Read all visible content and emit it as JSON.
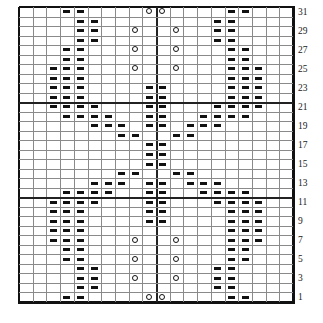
{
  "chart_data": {
    "type": "knitting-chart",
    "columns": 20,
    "rows": 31,
    "row_labels": [
      "1",
      "3",
      "5",
      "7",
      "9",
      "11",
      "13",
      "15",
      "17",
      "19",
      "21",
      "23",
      "25",
      "27",
      "29",
      "31"
    ],
    "major_horizontal_lines_above_rows": [
      21,
      11
    ],
    "major_vertical_line_after_column": 10,
    "legend_symbols": {
      "dash": "purl",
      "circle": "yarn-over"
    },
    "grid": [
      {
        "row": 31,
        "dash": [
          4,
          5,
          16,
          17
        ],
        "circle": [
          10,
          11
        ]
      },
      {
        "row": 30,
        "dash": [
          5,
          6,
          15,
          16
        ],
        "circle": []
      },
      {
        "row": 29,
        "dash": [
          5,
          6,
          15,
          16
        ],
        "circle": [
          9,
          12
        ]
      },
      {
        "row": 28,
        "dash": [
          5,
          6,
          15,
          16
        ],
        "circle": []
      },
      {
        "row": 27,
        "dash": [
          4,
          5,
          16,
          17
        ],
        "circle": [
          9,
          12
        ]
      },
      {
        "row": 26,
        "dash": [
          4,
          5,
          16,
          17
        ],
        "circle": []
      },
      {
        "row": 25,
        "dash": [
          3,
          4,
          5,
          16,
          17,
          18
        ],
        "circle": [
          9,
          12
        ]
      },
      {
        "row": 24,
        "dash": [
          3,
          4,
          5,
          16,
          17,
          18
        ],
        "circle": []
      },
      {
        "row": 23,
        "dash": [
          3,
          4,
          5,
          10,
          11,
          16,
          17,
          18
        ],
        "circle": []
      },
      {
        "row": 22,
        "dash": [
          3,
          4,
          5,
          10,
          11,
          16,
          17,
          18
        ],
        "circle": []
      },
      {
        "row": 21,
        "dash": [
          3,
          4,
          5,
          6,
          10,
          11,
          15,
          16,
          17,
          18
        ],
        "circle": []
      },
      {
        "row": 20,
        "dash": [
          4,
          5,
          6,
          7,
          10,
          11,
          14,
          15,
          16,
          17
        ],
        "circle": []
      },
      {
        "row": 19,
        "dash": [
          6,
          7,
          8,
          10,
          11,
          13,
          14,
          15
        ],
        "circle": []
      },
      {
        "row": 18,
        "dash": [
          8,
          9,
          12,
          13
        ],
        "circle": []
      },
      {
        "row": 17,
        "dash": [
          10,
          11
        ],
        "circle": []
      },
      {
        "row": 16,
        "dash": [
          10,
          11
        ],
        "circle": []
      },
      {
        "row": 15,
        "dash": [
          10,
          11
        ],
        "circle": []
      },
      {
        "row": 14,
        "dash": [
          8,
          9,
          12,
          13
        ],
        "circle": []
      },
      {
        "row": 13,
        "dash": [
          6,
          7,
          8,
          10,
          11,
          13,
          14,
          15
        ],
        "circle": []
      },
      {
        "row": 12,
        "dash": [
          4,
          5,
          6,
          7,
          10,
          11,
          14,
          15,
          16,
          17
        ],
        "circle": []
      },
      {
        "row": 11,
        "dash": [
          3,
          4,
          5,
          6,
          10,
          11,
          15,
          16,
          17,
          18
        ],
        "circle": []
      },
      {
        "row": 10,
        "dash": [
          3,
          4,
          5,
          10,
          11,
          16,
          17,
          18
        ],
        "circle": []
      },
      {
        "row": 9,
        "dash": [
          3,
          4,
          5,
          10,
          11,
          16,
          17,
          18
        ],
        "circle": []
      },
      {
        "row": 8,
        "dash": [
          3,
          4,
          5,
          16,
          17,
          18
        ],
        "circle": []
      },
      {
        "row": 7,
        "dash": [
          3,
          4,
          5,
          16,
          17,
          18
        ],
        "circle": [
          9,
          12
        ]
      },
      {
        "row": 6,
        "dash": [
          4,
          5,
          16,
          17
        ],
        "circle": []
      },
      {
        "row": 5,
        "dash": [
          4,
          5,
          16,
          17
        ],
        "circle": [
          9,
          12
        ]
      },
      {
        "row": 4,
        "dash": [
          5,
          6,
          15,
          16
        ],
        "circle": []
      },
      {
        "row": 3,
        "dash": [
          5,
          6,
          15,
          16
        ],
        "circle": [
          9,
          12
        ]
      },
      {
        "row": 2,
        "dash": [
          5,
          6,
          15,
          16
        ],
        "circle": []
      },
      {
        "row": 1,
        "dash": [
          4,
          5,
          16,
          17
        ],
        "circle": [
          10,
          11
        ]
      }
    ]
  }
}
